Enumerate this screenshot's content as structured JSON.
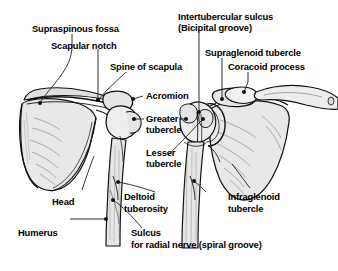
{
  "figure": {
    "background_color": "#ffffff",
    "ink_color": "#000000",
    "bone_fill_color": "#e8e8e8",
    "bone_shade_color": "#cfcfcf",
    "width": 338,
    "height": 271
  },
  "labels": [
    {
      "id": "supraspinous-fossa",
      "text": "Supraspinous fossa"
    },
    {
      "id": "scapular-notch",
      "text": "Scapular notch"
    },
    {
      "id": "spine-of-scapula",
      "text": "Spine of scapula"
    },
    {
      "id": "intertubercular-sulcus",
      "text": "Intertubercular sulcus"
    },
    {
      "id": "bicipital-groove",
      "text": "(Bicipital groove)"
    },
    {
      "id": "supraglenoid-tubercle",
      "text": "Supraglenoid tubercle"
    },
    {
      "id": "coracoid-process",
      "text": "Coracoid process"
    },
    {
      "id": "acromion",
      "text": "Acromion"
    },
    {
      "id": "greater-tubercle-line1",
      "text": "Greater"
    },
    {
      "id": "greater-tubercle-line2",
      "text": "tubercle"
    },
    {
      "id": "lesser-tubercle-line1",
      "text": "Lesser"
    },
    {
      "id": "lesser-tubercle-line2",
      "text": "tubercle"
    },
    {
      "id": "head",
      "text": "Head"
    },
    {
      "id": "humerus",
      "text": "Humerus"
    },
    {
      "id": "deltoid-tuberosity-line1",
      "text": "Deltoid"
    },
    {
      "id": "deltoid-tuberosity-line2",
      "text": "tuberosity"
    },
    {
      "id": "infraglenoid-tubercle-line1",
      "text": "Infraglenoid"
    },
    {
      "id": "infraglenoid-tubercle-line2",
      "text": "tubercle"
    },
    {
      "id": "sulcus",
      "text": "Sulcus"
    },
    {
      "id": "sulcus-radial-nerve",
      "text": "for radial nerve (spiral groove)"
    }
  ],
  "views": [
    {
      "id": "posterior-view",
      "name": "left scapula and humerus, posterior view"
    },
    {
      "id": "anterior-view",
      "name": "right scapula, clavicle and humerus, anterior view"
    }
  ]
}
